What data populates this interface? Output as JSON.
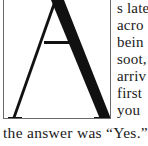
{
  "drop_cap": {
    "letter": "A"
  },
  "side_lines": [
    "s late",
    "acro",
    "bein",
    "soot,",
    "arriv",
    "first",
    "you"
  ],
  "bottom_line": "the answer was “Yes.”"
}
